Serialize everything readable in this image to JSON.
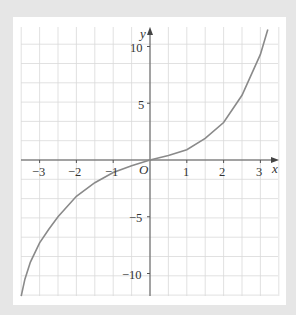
{
  "chart_data": {
    "type": "line",
    "title": "",
    "xlabel": "x",
    "ylabel": "y",
    "origin_label": "O",
    "xlim": [
      -3.5,
      3.5
    ],
    "ylim": [
      -12,
      11.5
    ],
    "grid": true,
    "x_ticks": [
      -3,
      -2,
      -1,
      1,
      2,
      3
    ],
    "x_tick_labels": [
      "−3",
      "−2",
      "−1",
      "1",
      "2",
      "3"
    ],
    "y_ticks": [
      10,
      5,
      -5,
      -10
    ],
    "y_tick_labels": [
      "10",
      "5",
      "−5",
      "−10"
    ],
    "series": [
      {
        "name": "curve",
        "color": "#8a8a8a",
        "x": [
          -3.5,
          -3.4,
          -3.25,
          -3.0,
          -2.75,
          -2.5,
          -2.0,
          -1.5,
          -1.0,
          -0.5,
          0,
          0.5,
          1.0,
          1.5,
          2.0,
          2.5,
          3.0,
          3.2
        ],
        "y": [
          -12.0,
          -10.5,
          -9.0,
          -7.3,
          -6.1,
          -5.0,
          -3.2,
          -2.0,
          -1.1,
          -0.5,
          0,
          0.4,
          0.9,
          1.9,
          3.3,
          5.7,
          9.3,
          11.5
        ]
      }
    ]
  },
  "labels": {
    "x_axis": "x",
    "y_axis": "y",
    "origin": "O",
    "xticks": [
      "−3",
      "−2",
      "−1",
      "1",
      "2",
      "3"
    ],
    "yticks": [
      "10",
      "5",
      "−5",
      "−10"
    ]
  }
}
